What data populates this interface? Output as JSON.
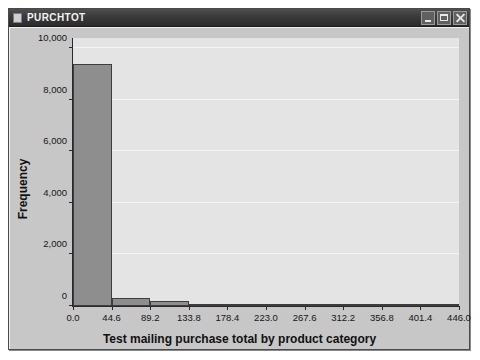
{
  "window": {
    "title": "PURCHTOT",
    "icon": "document-icon",
    "buttons": [
      {
        "name": "minimize-button",
        "label": "_"
      },
      {
        "name": "maximize-button",
        "label": "□"
      },
      {
        "name": "close-button",
        "label": "✕"
      }
    ]
  },
  "chart_data": {
    "type": "bar",
    "title": "",
    "subtitle": "",
    "xlabel": "Test mailing purchase total by product category",
    "ylabel": "Frequency",
    "x_tick_labels": [
      "0.0",
      "44.6",
      "89.2",
      "133.8",
      "178.4",
      "223.0",
      "267.6",
      "312.2",
      "356.8",
      "401.4",
      "446.0"
    ],
    "x_tick_values": [
      0.0,
      44.6,
      89.2,
      133.8,
      178.4,
      223.0,
      267.6,
      312.2,
      356.8,
      401.4,
      446.0
    ],
    "y_tick_labels": [
      "0",
      "2,000",
      "4,000",
      "6,000",
      "8,000",
      "10,000"
    ],
    "y_tick_values": [
      0,
      2000,
      4000,
      6000,
      8000,
      10000
    ],
    "xlim": [
      0.0,
      446.0
    ],
    "ylim": [
      0,
      10400
    ],
    "grid": true,
    "legend": false,
    "bin_width": 44.6,
    "bin_edges": [
      0.0,
      44.6,
      89.2,
      133.8,
      178.4,
      223.0,
      267.6,
      312.2,
      356.8,
      401.4,
      446.0
    ],
    "categories": [
      "0.0-44.6",
      "44.6-89.2",
      "89.2-133.8",
      "133.8-178.4",
      "178.4-223.0",
      "223.0-267.6",
      "267.6-312.2",
      "312.2-356.8",
      "356.8-401.4",
      "401.4-446.0"
    ],
    "values": [
      9400,
      300,
      200,
      60,
      40,
      30,
      20,
      15,
      10,
      8
    ],
    "bar_color": "#8e8e8e",
    "bar_edge_color": "#3d3d3d",
    "plot_background": "#e4e4e4",
    "gridline_color": "#f4f4f4"
  }
}
